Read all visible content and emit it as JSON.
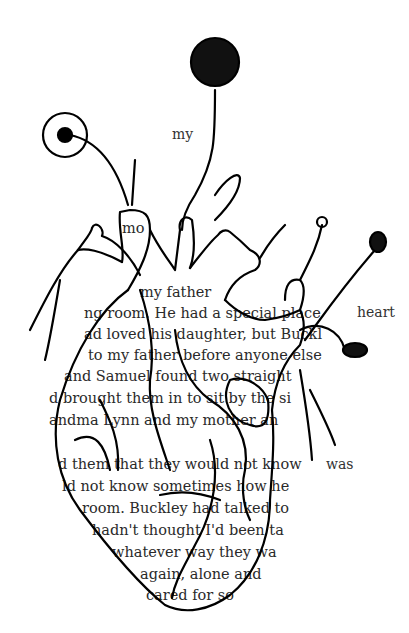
{
  "artwork": {
    "description": "Ink drawing of an anatomical heart with flowers growing from it, drawn over a page of book text",
    "ink_color": "#000000",
    "paper_color": "#ffffff",
    "text_color": "#2a2a2a"
  },
  "isolated_words": {
    "w1": "my",
    "w2": "heart",
    "w3": "was"
  },
  "book_lines": [
    "mo",
    "my father",
    "ng room. He had a special place",
    "ad loved his daughter, but Buckl",
    "to my father before anyone else",
    "and Samuel found two straight",
    "d brought them in to sit by the si",
    "andma Lynn and my mother an",
    "d them that they would not know",
    "ld not know sometimes how he",
    "room. Buckley had talked to",
    "hadn't thought I'd been ta",
    "whatever way they wa",
    "again, alone and",
    "cared for so"
  ]
}
